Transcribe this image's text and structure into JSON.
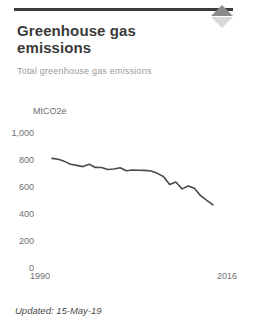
{
  "card": {
    "title": "Greenhouse gas emissions",
    "subtitle": "Total greenhouse gas emissions",
    "sort_icon": "sort-diamond-icon",
    "updated_label": "Updated: 15-May-19",
    "accent_color": "#3c3c3c",
    "line_color": "#4a4a4a",
    "text_color": "#3a3a3a",
    "muted_color": "#9a9a9a"
  },
  "chart_data": {
    "type": "line",
    "title": "Greenhouse gas emissions",
    "subtitle": "Total greenhouse gas emissions",
    "xlabel": "",
    "ylabel": "MtCO2e",
    "unit": "MtCO2e",
    "grid": false,
    "legend": "none",
    "xlim": [
      1990,
      2016
    ],
    "ylim": [
      0,
      1000
    ],
    "yticks": [
      "1,000",
      "800",
      "600",
      "400",
      "200",
      "0"
    ],
    "ytick_values": [
      1000,
      800,
      600,
      400,
      200,
      0
    ],
    "xticks": [
      "1990",
      "2016"
    ],
    "x": [
      1990,
      1991,
      1992,
      1993,
      1994,
      1995,
      1996,
      1997,
      1998,
      1999,
      2000,
      2001,
      2002,
      2003,
      2004,
      2005,
      2006,
      2007,
      2008,
      2009,
      2010,
      2011,
      2012,
      2013,
      2014,
      2015,
      2016
    ],
    "values": [
      812,
      806,
      790,
      768,
      760,
      751,
      768,
      745,
      744,
      730,
      733,
      742,
      720,
      726,
      724,
      723,
      718,
      701,
      678,
      618,
      637,
      586,
      608,
      591,
      536,
      501,
      468
    ],
    "series": [
      {
        "name": "Total greenhouse gas emissions",
        "values": [
          812,
          806,
          790,
          768,
          760,
          751,
          768,
          745,
          744,
          730,
          733,
          742,
          720,
          726,
          724,
          723,
          718,
          701,
          678,
          618,
          637,
          586,
          608,
          591,
          536,
          501,
          468
        ]
      }
    ]
  }
}
